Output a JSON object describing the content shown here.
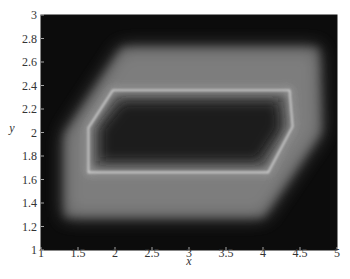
{
  "chart_data": {
    "type": "heatmap",
    "title": "",
    "xlabel": "x",
    "ylabel": "y",
    "xlim": [
      1,
      5
    ],
    "ylim": [
      1,
      3
    ],
    "xticks": [
      1,
      1.5,
      2,
      2.5,
      3,
      3.5,
      4,
      4.5,
      5
    ],
    "xtick_labels": [
      "1",
      "1.5",
      "2",
      "2.5",
      "3",
      "3.5",
      "4",
      "4.5",
      "5"
    ],
    "yticks": [
      1,
      1.2,
      1.4,
      1.6,
      1.8,
      2,
      2.2,
      2.4,
      2.6,
      2.8,
      3
    ],
    "ytick_labels": [
      "1",
      "1.2",
      "1.4",
      "1.6",
      "1.8",
      "2",
      "2.2",
      "2.4",
      "2.6",
      "2.8",
      "3"
    ],
    "grid": false,
    "legend": null,
    "colormap": "gray",
    "inner_bright_contour": [
      {
        "x": 1.97,
        "y": 2.36
      },
      {
        "x": 4.36,
        "y": 2.36
      },
      {
        "x": 4.4,
        "y": 2.05
      },
      {
        "x": 4.07,
        "y": 1.66
      },
      {
        "x": 1.64,
        "y": 1.66
      },
      {
        "x": 1.64,
        "y": 2.04
      }
    ],
    "outer_band_contour": [
      {
        "x": 2.1,
        "y": 2.72
      },
      {
        "x": 4.75,
        "y": 2.72
      },
      {
        "x": 4.78,
        "y": 2.0
      },
      {
        "x": 4.0,
        "y": 1.28
      },
      {
        "x": 1.32,
        "y": 1.28
      },
      {
        "x": 1.32,
        "y": 1.98
      }
    ],
    "intensity_range": {
      "background": "#0c0c0c",
      "band": "#7a7a7a",
      "ridge": "#d8d8d8",
      "interior": "#1a1a1a"
    }
  },
  "axes": {
    "xlabel": "x",
    "ylabel": "y"
  }
}
